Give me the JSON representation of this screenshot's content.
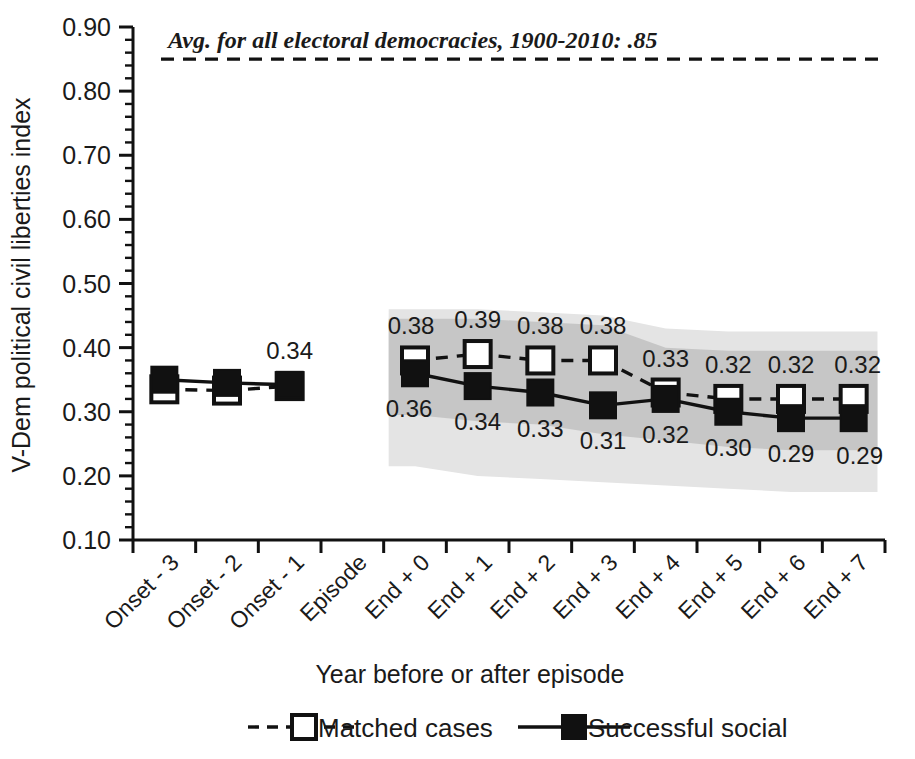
{
  "chart_data": {
    "type": "line",
    "title": "",
    "xlabel": "Year before or after episode",
    "ylabel": "V-Dem political civil liberties index",
    "ylim": [
      0.1,
      0.9
    ],
    "ytick_labels": [
      "0.90",
      "0.80",
      "0.70",
      "0.60",
      "0.50",
      "0.40",
      "0.30",
      "0.20",
      "0.10"
    ],
    "ytick_values": [
      0.9,
      0.8,
      0.7,
      0.6,
      0.5,
      0.4,
      0.3,
      0.2,
      0.1
    ],
    "minor_tick_step": 0.02,
    "grid": false,
    "legend_position": "bottom",
    "categories": [
      "Onset - 3",
      "Onset - 2",
      "Onset - 1",
      "Episode",
      "End + 0",
      "End + 1",
      "End + 2",
      "End + 3",
      "End + 4",
      "End + 5",
      "End + 6",
      "End + 7"
    ],
    "series": [
      {
        "name": "Matched cases",
        "marker": "open-square",
        "line": "dashed",
        "color": "#111111",
        "values": [
          0.335,
          0.333,
          0.34,
          null,
          0.38,
          0.39,
          0.38,
          0.38,
          0.33,
          0.32,
          0.32,
          0.32
        ],
        "labels": [
          "",
          "",
          "",
          "",
          "0.38",
          "0.39",
          "0.38",
          "0.38",
          "0.33",
          "0.32",
          "0.32",
          "0.32"
        ]
      },
      {
        "name": "Successful social",
        "marker": "filled-square",
        "line": "solid",
        "color": "#111111",
        "values": [
          0.35,
          0.345,
          0.342,
          null,
          0.36,
          0.34,
          0.33,
          0.31,
          0.32,
          0.3,
          0.29,
          0.29
        ],
        "labels": [
          "",
          "",
          "0.34",
          "",
          "0.36",
          "0.34",
          "0.33",
          "0.31",
          "0.32",
          "0.30",
          "0.29",
          "0.29"
        ]
      }
    ],
    "reference_line": {
      "value": 0.85,
      "style": "dashed",
      "annotation": "Avg. for all electoral democracies, 1900-2010: .85"
    },
    "bands": [
      {
        "name": "outer-confidence-band",
        "color": "#e4e4e4",
        "start_category": "End + 0",
        "end_category": "End + 7",
        "upper": [
          0.46,
          0.46,
          0.455,
          0.45,
          0.43,
          0.425,
          0.425,
          0.425
        ],
        "lower": [
          0.215,
          0.2,
          0.195,
          0.19,
          0.185,
          0.18,
          0.175,
          0.175
        ]
      },
      {
        "name": "inner-confidence-band",
        "color": "#c6c6c6",
        "start_category": "End + 0",
        "end_category": "End + 7",
        "upper": [
          0.445,
          0.445,
          0.44,
          0.435,
          0.4,
          0.395,
          0.395,
          0.395
        ],
        "lower": [
          0.295,
          0.285,
          0.28,
          0.265,
          0.255,
          0.245,
          0.24,
          0.24
        ]
      }
    ],
    "colors": {
      "ink": "#111111",
      "inner_band": "#c6c6c6",
      "outer_band": "#e4e4e4",
      "background": "#ffffff"
    }
  },
  "legend": {
    "items": [
      {
        "label": "Matched cases",
        "marker": "open-square",
        "line": "dashed"
      },
      {
        "label": "Successful social",
        "marker": "filled-square",
        "line": "solid"
      }
    ]
  }
}
